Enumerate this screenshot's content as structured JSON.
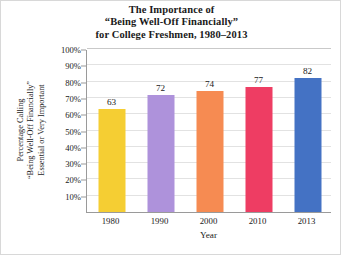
{
  "chart_data": {
    "type": "bar",
    "title": "The Importance of “Being Well-Off Financially” for College Freshmen, 1980–2013",
    "title_lines": [
      "The Importance of",
      "“Being Well-Off Financially”",
      "for College Freshmen, 1980–2013"
    ],
    "categories": [
      "1980",
      "1990",
      "2000",
      "2010",
      "2013"
    ],
    "values": [
      63,
      72,
      74,
      77,
      82
    ],
    "bar_colors": [
      "#F5CE33",
      "#AE92DB",
      "#F68B52",
      "#EE3D63",
      "#4472C4"
    ],
    "xlabel": "Year",
    "ylabel": "Percentage Calling “Being Well-Off Financially” Essential or Very Important",
    "ylabel_lines": [
      "Percentage Calling",
      "“Being Well-Off Financially”",
      "Essential or Very Important"
    ],
    "ylim": [
      0,
      100
    ],
    "ytick_values": [
      10,
      20,
      30,
      40,
      50,
      60,
      70,
      80,
      90,
      100
    ],
    "ytick_labels": [
      "10%",
      "20%",
      "30%",
      "40%",
      "50%",
      "60%",
      "70%",
      "80%",
      "90%",
      "100%"
    ],
    "grid": "horizontal",
    "legend": "none",
    "background_color": "#FFFFFF",
    "axis_color": "#9A9A9A",
    "gridline_color": "#E2E2E2"
  }
}
